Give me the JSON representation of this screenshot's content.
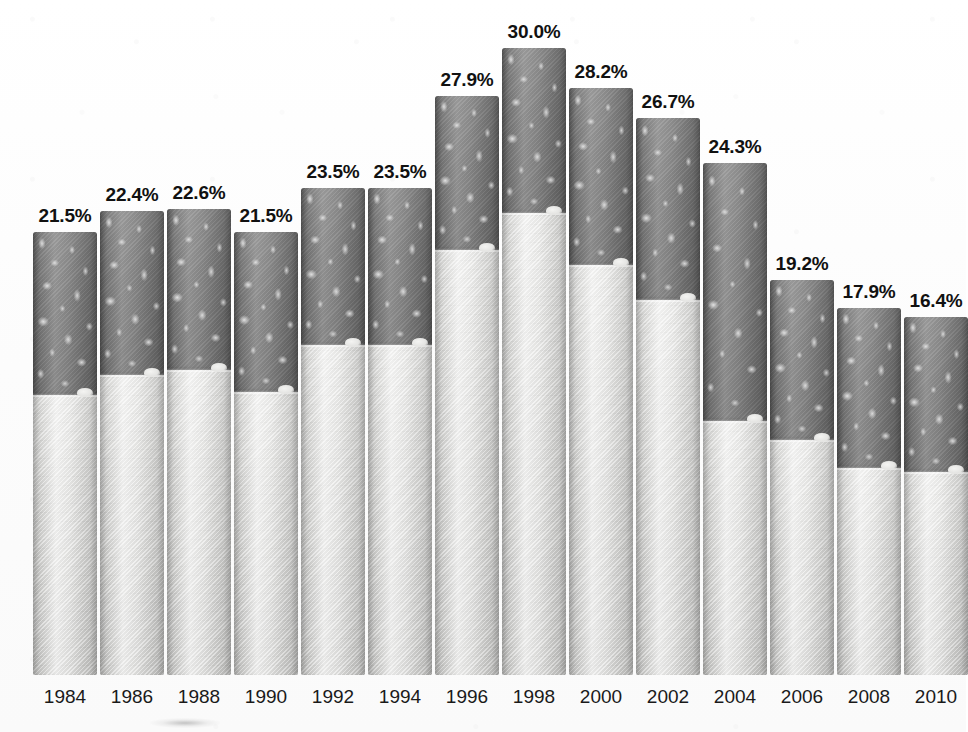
{
  "chart_data": {
    "type": "bar",
    "title": "",
    "subtitle": "",
    "xlabel": "",
    "ylabel": "",
    "grid": false,
    "legend": "none",
    "ylim": [
      0,
      32
    ],
    "categories": [
      "1984",
      "1986",
      "1988",
      "1990",
      "1992",
      "1994",
      "1996",
      "1998",
      "2000",
      "2002",
      "2004",
      "2006",
      "2008",
      "2010"
    ],
    "values": [
      21.5,
      22.4,
      22.6,
      21.5,
      23.5,
      23.5,
      27.9,
      30.0,
      28.2,
      26.7,
      24.3,
      19.2,
      17.9,
      16.4
    ],
    "value_labels": [
      "21.5%",
      "22.4%",
      "22.6%",
      "21.5%",
      "23.5%",
      "23.5%",
      "27.9%",
      "30.0%",
      "28.2%",
      "26.7%",
      "24.3%",
      "19.2%",
      "17.9%",
      "16.4%"
    ],
    "annotations": []
  },
  "style": {
    "background_color": "#fdfdfd",
    "bar_tobacco_color": "#818181",
    "bar_filter_color": "#dcdcda",
    "label_color": "#111111",
    "year_color": "#1a1a1a",
    "bar_motif": "cigarette"
  },
  "bars": [
    {
      "year": "1984",
      "label": "21.5%",
      "value": 21.5,
      "x": 33,
      "w": 64,
      "top": 232,
      "filter_top": 395
    },
    {
      "year": "1986",
      "label": "22.4%",
      "value": 22.4,
      "x": 100,
      "w": 64,
      "top": 211,
      "filter_top": 375
    },
    {
      "year": "1988",
      "label": "22.6%",
      "value": 22.6,
      "x": 167,
      "w": 64,
      "top": 209,
      "filter_top": 370
    },
    {
      "year": "1990",
      "label": "21.5%",
      "value": 21.5,
      "x": 234,
      "w": 64,
      "top": 232,
      "filter_top": 392
    },
    {
      "year": "1992",
      "label": "23.5%",
      "value": 23.5,
      "x": 301,
      "w": 64,
      "top": 188,
      "filter_top": 345
    },
    {
      "year": "1994",
      "label": "23.5%",
      "value": 23.5,
      "x": 368,
      "w": 64,
      "top": 188,
      "filter_top": 345
    },
    {
      "year": "1996",
      "label": "27.9%",
      "value": 27.9,
      "x": 435,
      "w": 64,
      "top": 96,
      "filter_top": 250
    },
    {
      "year": "1998",
      "label": "30.0%",
      "value": 30.0,
      "x": 502,
      "w": 64,
      "top": 48,
      "filter_top": 213
    },
    {
      "year": "2000",
      "label": "28.2%",
      "value": 28.2,
      "x": 569,
      "w": 64,
      "top": 88,
      "filter_top": 265
    },
    {
      "year": "2002",
      "label": "26.7%",
      "value": 26.7,
      "x": 636,
      "w": 64,
      "top": 118,
      "filter_top": 300
    },
    {
      "year": "2004",
      "label": "24.3%",
      "value": 24.3,
      "x": 703,
      "w": 64,
      "top": 163,
      "filter_top": 421
    },
    {
      "year": "2006",
      "label": "19.2%",
      "value": 19.2,
      "x": 770,
      "w": 64,
      "top": 280,
      "filter_top": 440
    },
    {
      "year": "2008",
      "label": "17.9%",
      "value": 17.9,
      "x": 837,
      "w": 64,
      "top": 308,
      "filter_top": 468
    },
    {
      "year": "2010",
      "label": "16.4%",
      "value": 16.4,
      "x": 904,
      "w": 64,
      "top": 317,
      "filter_top": 472
    }
  ],
  "label_positions": [
    {
      "x": 33,
      "y": 205
    },
    {
      "x": 100,
      "y": 184
    },
    {
      "x": 167,
      "y": 182
    },
    {
      "x": 234,
      "y": 205
    },
    {
      "x": 301,
      "y": 161
    },
    {
      "x": 368,
      "y": 161
    },
    {
      "x": 435,
      "y": 69
    },
    {
      "x": 502,
      "y": 21
    },
    {
      "x": 569,
      "y": 61
    },
    {
      "x": 636,
      "y": 91
    },
    {
      "x": 703,
      "y": 136
    },
    {
      "x": 770,
      "y": 253
    },
    {
      "x": 837,
      "y": 281
    },
    {
      "x": 904,
      "y": 290
    }
  ],
  "baseline_y": 675
}
